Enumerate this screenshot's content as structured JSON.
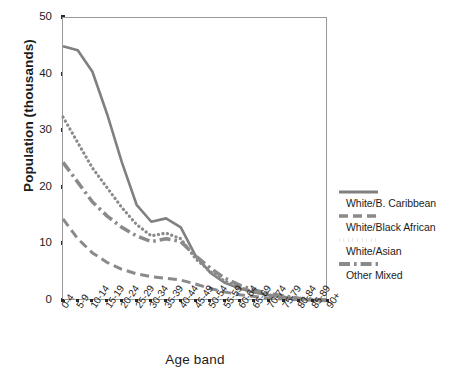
{
  "chart_data": {
    "type": "line",
    "title": "",
    "xlabel": "Age band",
    "ylabel": "Population (thousands)",
    "ylim": [
      0,
      50
    ],
    "yticks": [
      0,
      10,
      20,
      30,
      40,
      50
    ],
    "grid": false,
    "legend_position": "right",
    "categories": [
      "0-4",
      "5-9",
      "10-14",
      "15-19",
      "20-24",
      "25-29",
      "30-34",
      "35-39",
      "40-44",
      "45-49",
      "50-54",
      "55-59",
      "60-64",
      "65-69",
      "70-74",
      "75-79",
      "80-84",
      "85-89",
      "90+"
    ],
    "series": [
      {
        "name": "White/B. Caribbean",
        "style": "solid",
        "color": "#808080",
        "values": [
          45.0,
          44.3,
          40.5,
          33.0,
          24.5,
          17.0,
          14.0,
          14.6,
          13.0,
          8.0,
          5.0,
          3.2,
          2.2,
          1.5,
          1.0,
          0.7,
          0.4,
          0.2,
          0.1
        ]
      },
      {
        "name": "White/Black African",
        "style": "dashed",
        "color": "#8a8a8a",
        "values": [
          14.5,
          11.0,
          8.5,
          6.8,
          5.6,
          4.8,
          4.3,
          4.0,
          3.7,
          3.0,
          2.2,
          1.6,
          1.1,
          0.8,
          0.5,
          0.35,
          0.2,
          0.12,
          0.05
        ]
      },
      {
        "name": "White/Asian",
        "style": "dotted",
        "color": "#8a8a8a",
        "values": [
          32.5,
          28.0,
          23.5,
          20.0,
          16.5,
          13.5,
          11.5,
          12.0,
          11.0,
          7.5,
          5.2,
          3.5,
          2.4,
          1.6,
          1.1,
          0.7,
          0.4,
          0.2,
          0.1
        ]
      },
      {
        "name": "Other Mixed",
        "style": "dashdot",
        "color": "#8a8a8a",
        "values": [
          24.5,
          21.0,
          17.5,
          15.0,
          13.0,
          11.5,
          10.5,
          11.0,
          10.5,
          8.0,
          5.8,
          4.0,
          2.8,
          1.9,
          1.3,
          0.9,
          0.5,
          0.3,
          0.15
        ]
      }
    ]
  },
  "legend": {
    "items": [
      {
        "label": "White/B. Caribbean"
      },
      {
        "label": "White/Black African"
      },
      {
        "label": "White/Asian"
      },
      {
        "label": "Other Mixed"
      }
    ]
  }
}
